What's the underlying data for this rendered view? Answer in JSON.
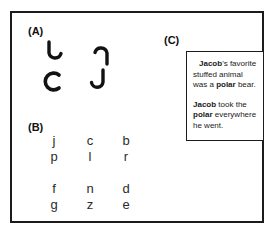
{
  "figure": {
    "panels": [
      {
        "id": "A",
        "label": "(A)",
        "type": "rotated-hook-shapes",
        "shapes": [
          {
            "name": "hook-rotation-0",
            "glyph": "J",
            "rotation_deg": 0,
            "description": "J hook, upright, opening to the left"
          },
          {
            "name": "hook-rotation-1",
            "glyph": "J",
            "rotation_deg": 180,
            "description": "J hook rotated half turn, opening to the right"
          },
          {
            "name": "hook-rotation-2",
            "glyph": "J",
            "rotation_deg": 90,
            "description": "J hook rotated quarter turn, C-like opening to the right"
          },
          {
            "name": "hook-rotation-3",
            "glyph": "J",
            "rotation_deg": 0,
            "description": "J hook, upright"
          }
        ]
      },
      {
        "id": "B",
        "label": "(B)",
        "type": "letter-pairs",
        "groups": [
          {
            "name": "group-upper",
            "columns": [
              {
                "top": "j",
                "bottom": "p"
              },
              {
                "top": "c",
                "bottom": "l"
              },
              {
                "top": "b",
                "bottom": "r"
              }
            ]
          },
          {
            "name": "group-lower",
            "columns": [
              {
                "top": "f",
                "bottom": "g"
              },
              {
                "top": "n",
                "bottom": "z"
              },
              {
                "top": "d",
                "bottom": "e"
              }
            ]
          }
        ]
      },
      {
        "id": "C",
        "label": "(C)",
        "type": "text-box",
        "text_box": {
          "paragraphs": [
            {
              "name": "sentence-1",
              "runs": [
                {
                  "text": "Jacob",
                  "bold": true
                },
                {
                  "text": "'s favorite stuffed animal was a ",
                  "bold": false
                },
                {
                  "text": "polar",
                  "bold": true
                },
                {
                  "text": " bear.",
                  "bold": false
                }
              ]
            },
            {
              "name": "sentence-2",
              "runs": [
                {
                  "text": "Jacob",
                  "bold": true
                },
                {
                  "text": " took the ",
                  "bold": false
                },
                {
                  "text": "polar",
                  "bold": true
                },
                {
                  "text": " everywhere he went.",
                  "bold": false
                }
              ]
            }
          ]
        }
      }
    ]
  },
  "colors": {
    "frame_stroke": "#1b1b1b",
    "text": "#1a1a1a",
    "glyph": "#2c2c2c",
    "background": "#ffffff"
  }
}
